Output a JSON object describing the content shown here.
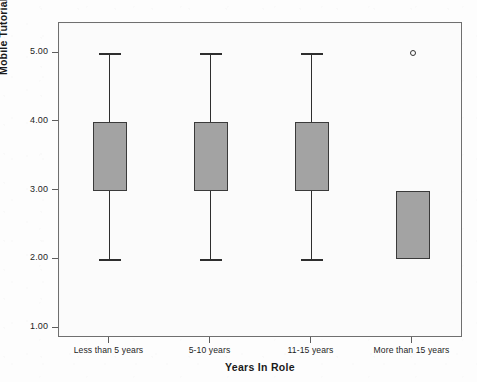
{
  "chart_data": {
    "type": "box",
    "title": "",
    "xlabel": "Years In Role",
    "ylabel": "Mobile Tutorial Usefulness",
    "ylim": [
      1.0,
      5.0
    ],
    "ytick_labels": [
      "5.00",
      "4.00",
      "3.00",
      "2.00",
      "1.00"
    ],
    "ytick_values": [
      5.0,
      4.0,
      3.0,
      2.0,
      1.0
    ],
    "grid": false,
    "legend": "none",
    "categories": [
      "Less than 5 years",
      "5-10 years",
      "11-15 years",
      "More than 15 years"
    ],
    "boxes": [
      {
        "category": "Less than 5 years",
        "whisker_low": 2.0,
        "q1": 3.0,
        "median": 3.0,
        "q3": 4.0,
        "whisker_high": 5.0,
        "outliers": []
      },
      {
        "category": "5-10 years",
        "whisker_low": 2.0,
        "q1": 3.0,
        "median": 3.0,
        "q3": 4.0,
        "whisker_high": 5.0,
        "outliers": []
      },
      {
        "category": "11-15 years",
        "whisker_low": 2.0,
        "q1": 3.0,
        "median": 3.0,
        "q3": 4.0,
        "whisker_high": 5.0,
        "outliers": []
      },
      {
        "category": "More than 15 years",
        "whisker_low": 2.0,
        "q1": 2.0,
        "median": 3.0,
        "q3": 3.0,
        "whisker_high": 3.0,
        "outliers": [
          5.0
        ]
      }
    ],
    "colors": {
      "box_fill": "#a3a3a3",
      "box_edge": "#3a3a3a",
      "whisker": "#2e2e2e",
      "frame": "#6f6f6f",
      "plot_background": "#fbfbfb",
      "text": "#1a1a1a"
    }
  }
}
